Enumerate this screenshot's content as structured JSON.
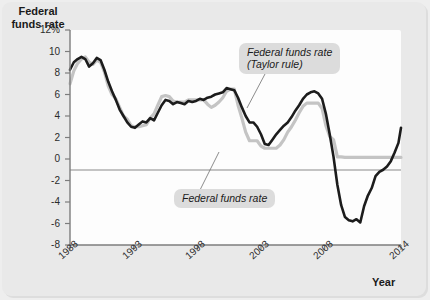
{
  "figure": {
    "background_color": "#e9e9e9",
    "panel_color": "#fdfdfd"
  },
  "axes": {
    "y_axis_title": "Federal\nfunds rate",
    "x_axis_title": "Year",
    "y_tick_labels": [
      "12%",
      "10",
      "8",
      "6",
      "4",
      "2",
      "0",
      "-2",
      "-4",
      "-6",
      "-8"
    ],
    "y_tick_values": [
      12,
      10,
      8,
      6,
      4,
      2,
      0,
      -2,
      -4,
      -6,
      -8
    ],
    "x_tick_labels": [
      "1988",
      "1993",
      "1998",
      "2003",
      "2008",
      "2014"
    ],
    "x_tick_values": [
      1988,
      1993,
      1998,
      2003,
      2008,
      2014
    ]
  },
  "annotations": [
    {
      "name": "callout-taylor-rule",
      "text": "Federal funds rate\n(Taylor rule)",
      "target_series": "Federal funds rate (Taylor rule)"
    },
    {
      "name": "callout-actual-rate",
      "text": "Federal funds rate",
      "target_series": "Federal funds rate"
    }
  ],
  "chart_data": {
    "type": "line",
    "title": "",
    "xlabel": "Year",
    "ylabel": "Federal funds rate",
    "xlim": [
      1988,
      2014
    ],
    "ylim": [
      -8,
      12
    ],
    "ytick_step": 2,
    "grid": false,
    "zero_line": true,
    "legend_position": "inline-callouts",
    "series": [
      {
        "name": "Federal funds rate (Taylor rule)",
        "color": "#1c1c1c",
        "width": 2.6,
        "points": [
          [
            1988.0,
            8.3
          ],
          [
            1988.3,
            9.0
          ],
          [
            1988.6,
            9.3
          ],
          [
            1988.9,
            9.5
          ],
          [
            1989.2,
            9.3
          ],
          [
            1989.5,
            8.6
          ],
          [
            1989.8,
            8.9
          ],
          [
            1990.1,
            9.4
          ],
          [
            1990.4,
            9.2
          ],
          [
            1990.7,
            8.3
          ],
          [
            1991.0,
            7.2
          ],
          [
            1991.3,
            6.3
          ],
          [
            1991.6,
            5.5
          ],
          [
            1991.9,
            4.6
          ],
          [
            1992.2,
            4.0
          ],
          [
            1992.5,
            3.4
          ],
          [
            1992.8,
            3.0
          ],
          [
            1993.1,
            2.9
          ],
          [
            1993.4,
            3.2
          ],
          [
            1993.7,
            3.5
          ],
          [
            1994.0,
            3.4
          ],
          [
            1994.3,
            3.8
          ],
          [
            1994.6,
            3.6
          ],
          [
            1994.9,
            4.3
          ],
          [
            1995.2,
            5.0
          ],
          [
            1995.5,
            5.5
          ],
          [
            1995.8,
            5.4
          ],
          [
            1996.1,
            5.1
          ],
          [
            1996.4,
            5.3
          ],
          [
            1996.7,
            5.2
          ],
          [
            1997.0,
            5.1
          ],
          [
            1997.3,
            5.4
          ],
          [
            1997.6,
            5.3
          ],
          [
            1997.9,
            5.4
          ],
          [
            1998.2,
            5.6
          ],
          [
            1998.5,
            5.5
          ],
          [
            1998.8,
            5.7
          ],
          [
            1999.1,
            5.8
          ],
          [
            1999.4,
            6.0
          ],
          [
            1999.7,
            6.1
          ],
          [
            2000.0,
            6.2
          ],
          [
            2000.3,
            6.6
          ],
          [
            2000.6,
            6.5
          ],
          [
            2000.9,
            6.4
          ],
          [
            2001.2,
            5.7
          ],
          [
            2001.5,
            4.8
          ],
          [
            2001.8,
            4.0
          ],
          [
            2002.1,
            3.4
          ],
          [
            2002.4,
            3.4
          ],
          [
            2002.7,
            3.0
          ],
          [
            2003.0,
            2.3
          ],
          [
            2003.3,
            1.4
          ],
          [
            2003.6,
            1.3
          ],
          [
            2003.9,
            1.8
          ],
          [
            2004.2,
            2.3
          ],
          [
            2004.5,
            2.7
          ],
          [
            2004.8,
            3.1
          ],
          [
            2005.1,
            3.4
          ],
          [
            2005.4,
            3.9
          ],
          [
            2005.7,
            4.5
          ],
          [
            2006.0,
            5.0
          ],
          [
            2006.3,
            5.6
          ],
          [
            2006.6,
            6.0
          ],
          [
            2006.9,
            6.2
          ],
          [
            2007.2,
            6.3
          ],
          [
            2007.5,
            6.1
          ],
          [
            2007.8,
            5.6
          ],
          [
            2008.1,
            4.2
          ],
          [
            2008.4,
            2.3
          ],
          [
            2008.7,
            0.2
          ],
          [
            2009.0,
            -2.4
          ],
          [
            2009.3,
            -4.3
          ],
          [
            2009.6,
            -5.4
          ],
          [
            2009.9,
            -5.7
          ],
          [
            2010.2,
            -5.8
          ],
          [
            2010.5,
            -5.6
          ],
          [
            2010.8,
            -5.9
          ],
          [
            2011.1,
            -4.4
          ],
          [
            2011.4,
            -3.4
          ],
          [
            2011.7,
            -2.7
          ],
          [
            2012.0,
            -1.6
          ],
          [
            2012.3,
            -1.2
          ],
          [
            2012.6,
            -1.0
          ],
          [
            2012.9,
            -0.7
          ],
          [
            2013.2,
            -0.2
          ],
          [
            2013.5,
            0.6
          ],
          [
            2013.8,
            1.5
          ],
          [
            2014.0,
            2.9
          ]
        ]
      },
      {
        "name": "Federal funds rate",
        "color": "#c4c4c4",
        "width": 3.2,
        "points": [
          [
            1988.0,
            7.0
          ],
          [
            1988.3,
            8.2
          ],
          [
            1988.6,
            8.9
          ],
          [
            1988.9,
            9.3
          ],
          [
            1989.2,
            9.5
          ],
          [
            1989.5,
            9.0
          ],
          [
            1989.8,
            8.8
          ],
          [
            1990.1,
            9.2
          ],
          [
            1990.4,
            9.0
          ],
          [
            1990.7,
            8.1
          ],
          [
            1991.0,
            6.8
          ],
          [
            1991.3,
            6.0
          ],
          [
            1991.6,
            5.6
          ],
          [
            1991.9,
            4.8
          ],
          [
            1992.2,
            4.0
          ],
          [
            1992.5,
            3.7
          ],
          [
            1992.8,
            3.1
          ],
          [
            1993.1,
            3.0
          ],
          [
            1993.4,
            3.0
          ],
          [
            1993.7,
            3.1
          ],
          [
            1994.0,
            3.2
          ],
          [
            1994.3,
            3.8
          ],
          [
            1994.6,
            4.2
          ],
          [
            1994.9,
            5.0
          ],
          [
            1995.2,
            5.8
          ],
          [
            1995.5,
            5.9
          ],
          [
            1995.8,
            5.8
          ],
          [
            1996.1,
            5.4
          ],
          [
            1996.4,
            5.3
          ],
          [
            1996.7,
            5.3
          ],
          [
            1997.0,
            5.3
          ],
          [
            1997.3,
            5.5
          ],
          [
            1997.6,
            5.5
          ],
          [
            1997.9,
            5.5
          ],
          [
            1998.2,
            5.5
          ],
          [
            1998.5,
            5.5
          ],
          [
            1998.8,
            5.1
          ],
          [
            1999.1,
            4.8
          ],
          [
            1999.4,
            5.0
          ],
          [
            1999.7,
            5.3
          ],
          [
            2000.0,
            5.7
          ],
          [
            2000.3,
            6.3
          ],
          [
            2000.6,
            6.5
          ],
          [
            2000.9,
            6.5
          ],
          [
            2001.2,
            5.0
          ],
          [
            2001.5,
            3.8
          ],
          [
            2001.8,
            2.5
          ],
          [
            2002.1,
            1.7
          ],
          [
            2002.4,
            1.7
          ],
          [
            2002.7,
            1.7
          ],
          [
            2003.0,
            1.2
          ],
          [
            2003.3,
            1.0
          ],
          [
            2003.6,
            1.0
          ],
          [
            2003.9,
            1.0
          ],
          [
            2004.2,
            1.0
          ],
          [
            2004.5,
            1.3
          ],
          [
            2004.8,
            1.8
          ],
          [
            2005.1,
            2.5
          ],
          [
            2005.4,
            3.0
          ],
          [
            2005.7,
            3.6
          ],
          [
            2006.0,
            4.3
          ],
          [
            2006.3,
            4.9
          ],
          [
            2006.6,
            5.2
          ],
          [
            2006.9,
            5.2
          ],
          [
            2007.2,
            5.2
          ],
          [
            2007.5,
            5.2
          ],
          [
            2007.8,
            4.7
          ],
          [
            2008.1,
            3.1
          ],
          [
            2008.4,
            2.1
          ],
          [
            2008.7,
            1.8
          ],
          [
            2009.0,
            0.2
          ],
          [
            2009.3,
            0.2
          ],
          [
            2009.6,
            0.15
          ],
          [
            2009.9,
            0.15
          ],
          [
            2010.5,
            0.15
          ],
          [
            2011.0,
            0.15
          ],
          [
            2011.5,
            0.15
          ],
          [
            2012.0,
            0.15
          ],
          [
            2012.5,
            0.15
          ],
          [
            2013.0,
            0.15
          ],
          [
            2013.5,
            0.15
          ],
          [
            2014.0,
            0.15
          ]
        ]
      }
    ]
  }
}
